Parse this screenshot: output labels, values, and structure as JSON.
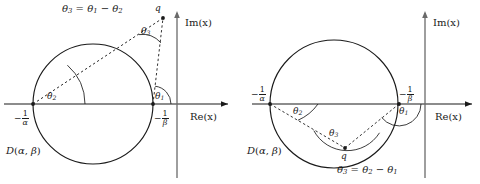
{
  "figure": {
    "type": "geometric-diagram",
    "colors": {
      "stroke": "#1a1a1a",
      "axis": "#555555",
      "background": "#ffffff"
    }
  },
  "panels": [
    {
      "id": "left",
      "q_position": "outside-above-right",
      "formula": "θ₃ = θ₁ − θ₂",
      "formula_parts": {
        "lhs": "θ",
        "lhs_sub": "3",
        "op1": "=",
        "t1": "θ",
        "t1_sub": "1",
        "op2": "−",
        "t2": "θ",
        "t2_sub": "2"
      },
      "axis_labels": {
        "imaginary": "Im(x)",
        "real": "Re(x)"
      },
      "point_labels": {
        "q": "q",
        "alpha_num": "1",
        "alpha_den": "α",
        "alpha_sign": "−",
        "beta_num": "1",
        "beta_den": "β",
        "beta_sign": "−"
      },
      "angles": [
        {
          "name": "θ",
          "sub": "1",
          "vertex": "-1/beta"
        },
        {
          "name": "θ",
          "sub": "2",
          "vertex": "-1/alpha"
        },
        {
          "name": "θ",
          "sub": "3",
          "vertex": "q"
        }
      ],
      "disk_label": {
        "d": "D",
        "open": "(",
        "alpha": "α",
        "comma": ",",
        "beta": "β",
        "close": ")"
      }
    },
    {
      "id": "right",
      "q_position": "inside-below-center",
      "formula": "θ₃ = θ₂ − θ₁",
      "formula_parts": {
        "lhs": "θ",
        "lhs_sub": "3",
        "op1": "=",
        "t1": "θ",
        "t1_sub": "2",
        "op2": "−",
        "t2": "θ",
        "t2_sub": "1"
      },
      "axis_labels": {
        "imaginary": "Im(x)",
        "real": "Re(x)"
      },
      "point_labels": {
        "q": "q",
        "alpha_num": "1",
        "alpha_den": "α",
        "alpha_sign": "−",
        "beta_num": "1",
        "beta_den": "β",
        "beta_sign": "−"
      },
      "angles": [
        {
          "name": "θ",
          "sub": "1",
          "vertex": "-1/beta"
        },
        {
          "name": "θ",
          "sub": "2",
          "vertex": "-1/alpha"
        },
        {
          "name": "θ",
          "sub": "3",
          "vertex": "q"
        }
      ],
      "disk_label": {
        "d": "D",
        "open": "(",
        "alpha": "α",
        "comma": ",",
        "beta": "β",
        "close": ")"
      }
    }
  ],
  "geometry": {
    "left": {
      "circle_cx": 93,
      "circle_cy": 104,
      "circle_r": 60,
      "pt_alpha_x": 33,
      "pt_beta_x": 153,
      "q_x": 163,
      "q_y": 18,
      "imaxis_x": 177,
      "reaxis_y": 104
    },
    "right": {
      "circle_cx": 334,
      "circle_cy": 104,
      "circle_r": 64,
      "pt_alpha_x": 270,
      "pt_beta_x": 399,
      "q_x": 345,
      "q_y": 148,
      "imaxis_x": 425,
      "reaxis_y": 104
    }
  }
}
